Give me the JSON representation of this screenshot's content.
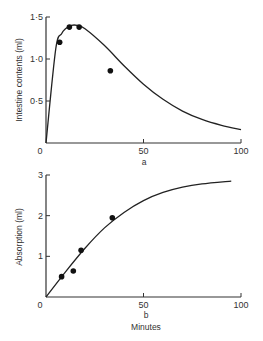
{
  "chart_data": [
    {
      "type": "line",
      "panel": "a",
      "title": "",
      "xlabel": "a",
      "ylabel": "Intestine contents (ml)",
      "xlim": [
        0,
        100
      ],
      "ylim": [
        0,
        1.5
      ],
      "x_ticks": [
        "0",
        "50",
        "100"
      ],
      "y_ticks": [
        "0",
        "0·5",
        "1·0",
        "1·5"
      ],
      "scatter": {
        "x": [
          7,
          12,
          17,
          33
        ],
        "y": [
          1.2,
          1.38,
          1.38,
          0.86
        ]
      },
      "curve": {
        "x": [
          0,
          5,
          8,
          10,
          13,
          16,
          20,
          30,
          40,
          50,
          60,
          70,
          80,
          90,
          100
        ],
        "y": [
          0,
          1.12,
          1.3,
          1.36,
          1.4,
          1.4,
          1.36,
          1.16,
          0.92,
          0.7,
          0.52,
          0.38,
          0.28,
          0.21,
          0.16
        ]
      },
      "grid": false
    },
    {
      "type": "line",
      "panel": "b",
      "title": "",
      "xlabel": "Minutes",
      "panel_label": "b",
      "ylabel": "Absorption (ml)",
      "xlim": [
        0,
        100
      ],
      "ylim": [
        0,
        3
      ],
      "x_ticks": [
        "0",
        "50",
        "100"
      ],
      "y_ticks": [
        "0",
        "1",
        "2",
        "3"
      ],
      "scatter": {
        "x": [
          8,
          14,
          18,
          34
        ],
        "y": [
          0.5,
          0.64,
          1.15,
          1.95
        ]
      },
      "curve": {
        "x": [
          0,
          10,
          20,
          30,
          40,
          50,
          60,
          70,
          80,
          95
        ],
        "y": [
          0,
          0.62,
          1.2,
          1.7,
          2.08,
          2.37,
          2.57,
          2.7,
          2.78,
          2.85
        ]
      },
      "grid": false
    }
  ],
  "labels": {
    "a_ylabel": "Intestine contents (ml)",
    "a_xlabel": "a",
    "b_ylabel": "Absorption (ml)",
    "b_panel": "b",
    "b_xlabel": "Minutes"
  }
}
